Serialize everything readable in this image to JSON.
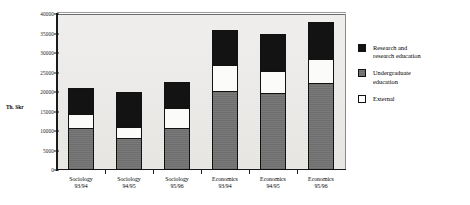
{
  "chart_data": {
    "type": "bar",
    "subtype": "stacked",
    "title": "",
    "xlabel": "",
    "ylabel": "Th. Skr",
    "ylim": [
      0,
      40000
    ],
    "ytick_step": 5000,
    "yticks": [
      "40000",
      "35000",
      "30000",
      "25000",
      "20000",
      "15000",
      "10000",
      "5000",
      "0"
    ],
    "ytick_values": [
      40000,
      35000,
      30000,
      25000,
      20000,
      15000,
      10000,
      5000,
      0
    ],
    "grid": false,
    "legend_position": "right",
    "categories": [
      "Sociology 93/94",
      "Sociology 94/95",
      "Sociology 95/96",
      "Economics 93/94",
      "Economics 94/95",
      "Economics 95/96"
    ],
    "category_lines": [
      [
        "Sociology",
        "93/94"
      ],
      [
        "Sociology",
        "94/95"
      ],
      [
        "Sociology",
        "95/96"
      ],
      [
        "Economics",
        "93/94"
      ],
      [
        "Economics",
        "94/95"
      ],
      [
        "Economics",
        "95/96"
      ]
    ],
    "series": [
      {
        "name": "Undergraduate education",
        "color": "#737373",
        "values": [
          10500,
          8000,
          10500,
          20000,
          19500,
          22000
        ]
      },
      {
        "name": "External",
        "color": "#fbfbf9",
        "values": [
          4000,
          3000,
          5500,
          7000,
          6000,
          6500
        ]
      },
      {
        "name": "Research and research education",
        "color": "#131313",
        "values": [
          6500,
          9000,
          6500,
          9000,
          9500,
          9500
        ]
      }
    ],
    "totals": [
      21000,
      20000,
      22500,
      36000,
      35000,
      38000
    ]
  },
  "legend": {
    "items": [
      {
        "label": "Research and\nresearch education",
        "swatch": "black"
      },
      {
        "label": "Undergraduate\neducation",
        "swatch": "gray"
      },
      {
        "label": "External",
        "swatch": "white"
      }
    ]
  }
}
